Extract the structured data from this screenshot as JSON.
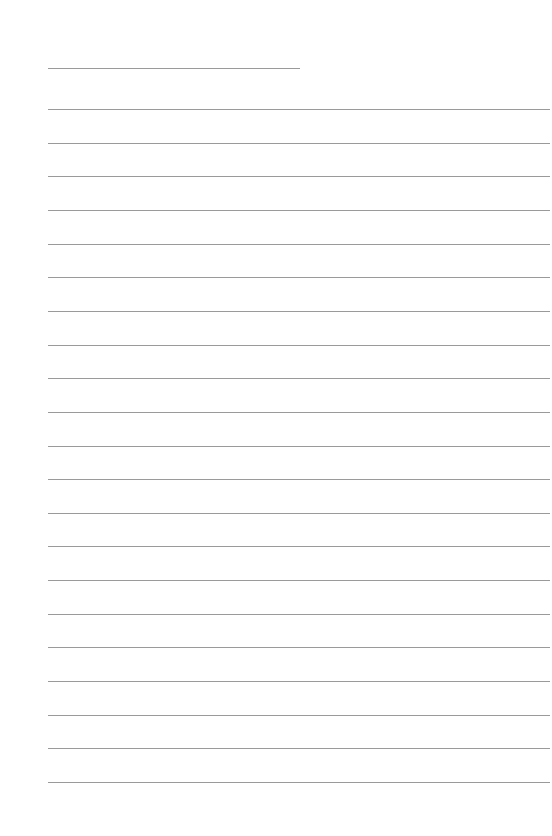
{
  "page": {
    "type": "lined-paper",
    "background_color": "#ffffff",
    "line_color": "#9a9a9a",
    "header_line": {
      "x_start": 48,
      "x_end": 300,
      "y": 68
    },
    "ruled_lines": {
      "x_start": 48,
      "x_end": 550,
      "y_first": 109,
      "spacing": 33.65,
      "count": 21
    }
  }
}
